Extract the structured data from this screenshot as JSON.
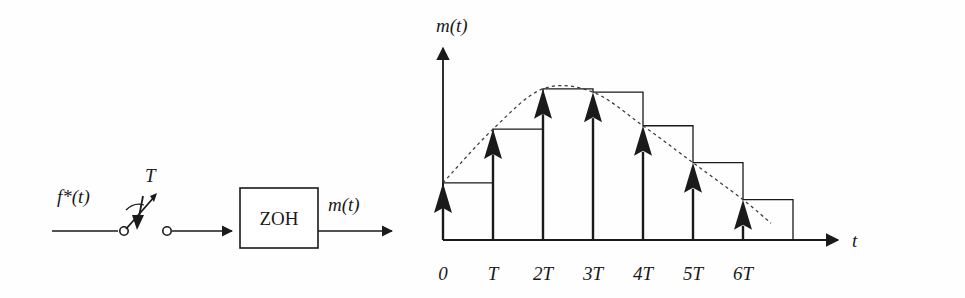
{
  "figure": {
    "background_color": "#fefefe",
    "stroke_color": "#1a1a1a",
    "width": 965,
    "height": 298
  },
  "block_diagram": {
    "input_label": "f*(t)",
    "sampler_label": "T",
    "block_label": "ZOH",
    "output_label": "m(t)",
    "icons": {
      "sampler": "sampling-switch-icon",
      "flow_arrow": "arrow-right-icon"
    }
  },
  "plot": {
    "y_axis_label": "m(t)",
    "x_axis_label": "t",
    "origin_px": {
      "x": 443,
      "y": 240
    },
    "period_px": 50,
    "axis_color": "#1a1a1a",
    "envelope_style": "dashed",
    "envelope_color": "#3a3a3a"
  },
  "chart_data": {
    "type": "bar",
    "title": "",
    "xlabel": "t",
    "ylabel": "m(t)",
    "categories": [
      "0",
      "T",
      "2T",
      "3T",
      "4T",
      "5T",
      "6T"
    ],
    "values": [
      0.34,
      0.66,
      0.9,
      0.88,
      0.68,
      0.46,
      0.24
    ],
    "ylim": [
      0,
      1.0
    ],
    "grid": false,
    "legend": null,
    "series": [
      {
        "name": "sampled impulses",
        "render": "impulse-arrows",
        "values": [
          0.34,
          0.66,
          0.9,
          0.88,
          0.68,
          0.46,
          0.24
        ]
      },
      {
        "name": "zero-order-hold staircase",
        "render": "staircase",
        "values": [
          0.34,
          0.66,
          0.9,
          0.88,
          0.68,
          0.46,
          0.24
        ]
      },
      {
        "name": "continuous envelope",
        "render": "dashed-curve",
        "values": [
          0.34,
          0.66,
          0.9,
          0.88,
          0.68,
          0.46,
          0.24
        ]
      }
    ],
    "annotations": []
  }
}
